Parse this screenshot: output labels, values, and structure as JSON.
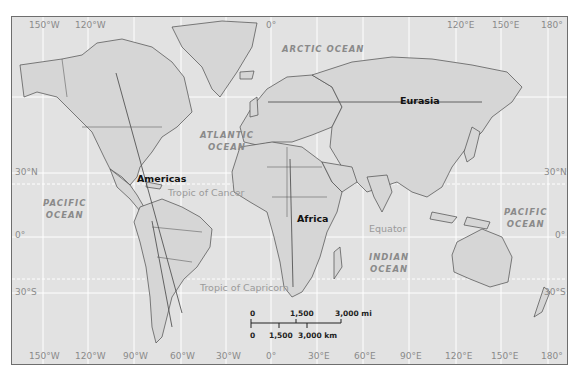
{
  "map": {
    "title": "World map with regional lines",
    "background_color": "#e2e2e2",
    "land_color": "#d8d8d8",
    "gridline_color": "#ffffff",
    "longitude_labels_top": [
      "150°W",
      "120°W",
      "0°",
      "120°E",
      "150°E",
      "180°"
    ],
    "longitude_labels_bottom": [
      "150°W",
      "120°W",
      "90°W",
      "60°W",
      "30°W",
      "0°",
      "30°E",
      "60°E",
      "90°E",
      "120°E",
      "150°E",
      "180°"
    ],
    "latitude_labels_left": [
      "30°N",
      "0°",
      "30°S"
    ],
    "latitude_labels_right": [
      "30°N",
      "0°",
      "30°S"
    ],
    "oceans": {
      "arctic": "ARCTIC OCEAN",
      "atlantic_line1": "ATLANTIC",
      "atlantic_line2": "OCEAN",
      "pacific_west_line1": "PACIFIC",
      "pacific_west_line2": "OCEAN",
      "pacific_east_line1": "PACIFIC",
      "pacific_east_line2": "OCEAN",
      "indian_line1": "INDIAN",
      "indian_line2": "OCEAN"
    },
    "reference_lines": {
      "tropic_cancer": "Tropic of Cancer",
      "tropic_capricorn": "Tropic of Capricorn",
      "equator": "Equator"
    },
    "regions": {
      "americas": "Americas",
      "eurasia": "Eurasia",
      "africa": "Africa"
    },
    "scale_bar": {
      "miles": [
        "0",
        "1,500",
        "3,000 mi"
      ],
      "kilometers": [
        "0",
        "1,500",
        "3,000 km"
      ]
    }
  }
}
